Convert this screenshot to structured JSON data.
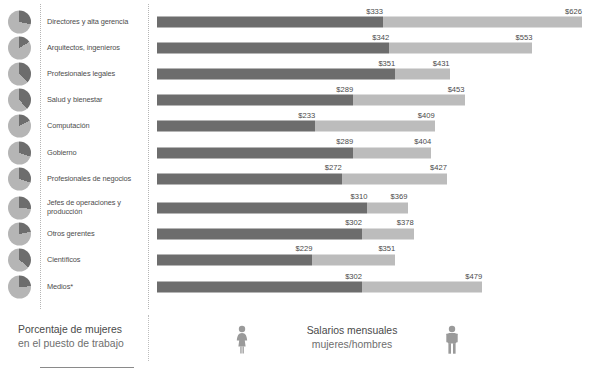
{
  "chart_data": {
    "type": "bar",
    "title": "",
    "subtitle": "",
    "xlabel": "",
    "ylabel": "",
    "orientation": "horizontal",
    "grid": false,
    "legend_position": "bottom",
    "axis_note": "Bars are stacked/overlaid: dark segment = women's monthly salary, full bar length = men's monthly salary.",
    "categories": [
      "Directores y alta gerencia",
      "Arquitectos, ingenieros",
      "Profesionales legales",
      "Salud y bienestar",
      "Computación",
      "Gobierno",
      "Profesionales de negocios",
      "Jefes de operaciones y producción",
      "Otros gerentes",
      "Científicos",
      "Medios*"
    ],
    "series": [
      {
        "name": "mujeres",
        "color": "#6d6d6d",
        "values": [
          333,
          342,
          351,
          289,
          233,
          289,
          272,
          310,
          302,
          229,
          302
        ],
        "labels": [
          "$333",
          "$342",
          "$351",
          "$289",
          "$233",
          "$289",
          "$272",
          "$310",
          "$302",
          "$229",
          "$302"
        ]
      },
      {
        "name": "hombres",
        "color": "#bcbcbc",
        "values": [
          626,
          553,
          431,
          453,
          409,
          404,
          427,
          369,
          378,
          351,
          479
        ],
        "labels": [
          "$626",
          "$553",
          "$431",
          "$453",
          "$409",
          "$404",
          "$427",
          "$369",
          "$378",
          "$351",
          "$479"
        ]
      }
    ],
    "women_share_pct": [
      28,
      16,
      37,
      39,
      17,
      30,
      30,
      26,
      22,
      36,
      24
    ],
    "xlim": [
      0,
      626
    ]
  },
  "rows": [
    {
      "label": "Directores y alta gerencia",
      "women": "$333",
      "men": "$626",
      "pie_pct": 28
    },
    {
      "label": "Arquitectos, ingenieros",
      "women": "$342",
      "men": "$553",
      "pie_pct": 16
    },
    {
      "label": "Profesionales legales",
      "women": "$351",
      "men": "$431",
      "pie_pct": 37
    },
    {
      "label": "Salud y bienestar",
      "women": "$289",
      "men": "$453",
      "pie_pct": 39
    },
    {
      "label": "Computación",
      "women": "$233",
      "men": "$409",
      "pie_pct": 17
    },
    {
      "label": "Gobierno",
      "women": "$289",
      "men": "$404",
      "pie_pct": 30
    },
    {
      "label": "Profesionales de negocios",
      "women": "$272",
      "men": "$427",
      "pie_pct": 30
    },
    {
      "label": "Jefes de operaciones y producción",
      "women": "$310",
      "men": "$369",
      "pie_pct": 26
    },
    {
      "label": "Otros gerentes",
      "women": "$302",
      "men": "$378",
      "pie_pct": 22
    },
    {
      "label": "Científicos",
      "women": "$229",
      "men": "$351",
      "pie_pct": 36
    },
    {
      "label": "Medios*",
      "women": "$302",
      "men": "$479",
      "pie_pct": 24
    }
  ],
  "legend": {
    "left_line1": "Porcentaje de mujeres",
    "left_line2": "en el puesto de trabajo",
    "center_line1": "Salarios mensuales",
    "center_line2": "mujeres/hombres",
    "female_icon": "female-figure-icon",
    "male_icon": "male-figure-icon"
  },
  "colors": {
    "women_bar": "#6d6d6d",
    "men_bar": "#bcbcbc",
    "pie_dark": "#6d6d6d",
    "pie_light": "#b5b5b5",
    "text": "#4a4a4a",
    "text_muted": "#6e6e6e",
    "rule": "#b5b5b5"
  }
}
